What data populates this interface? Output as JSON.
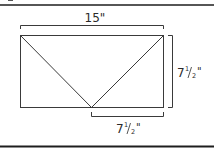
{
  "diagram": {
    "shape": "rectangle-with-v-triangles",
    "labels": {
      "top_width": "15\"",
      "right_height": {
        "whole": "7",
        "num": "1",
        "den": "2",
        "unit": "\""
      },
      "bottom_half": {
        "whole": "7",
        "num": "1",
        "den": "2",
        "unit": "\""
      }
    },
    "colors": {
      "line": "#3a3a3a",
      "border": "#1e1e1e",
      "background": "#ffffff"
    }
  }
}
